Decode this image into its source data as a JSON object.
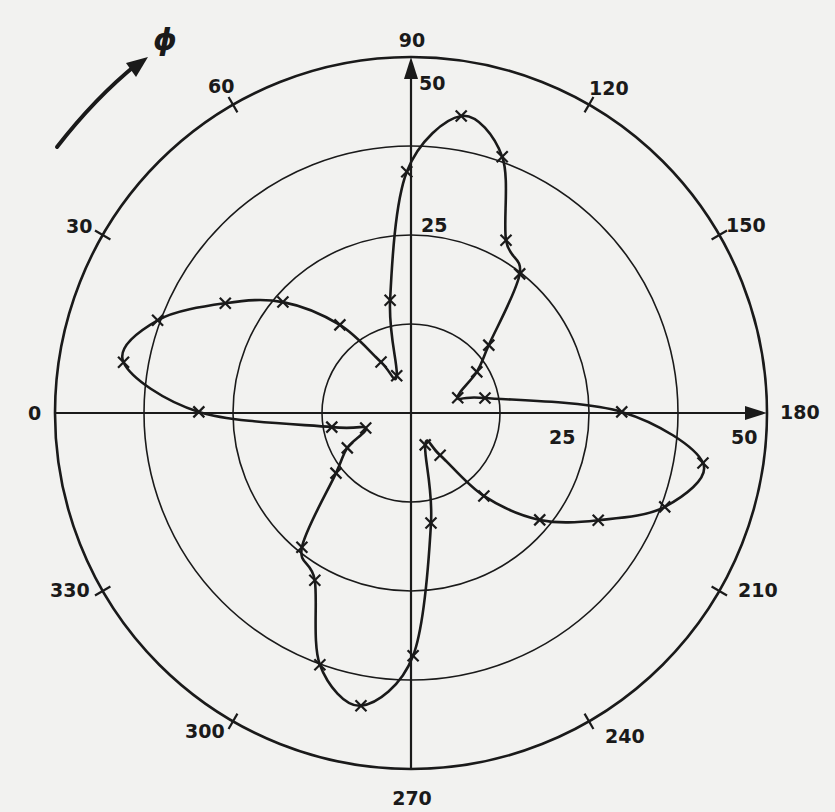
{
  "figure": {
    "background": "#f2f2f0",
    "ink": "#1a1a1a",
    "phi_label": "ϕ"
  },
  "chart_data": {
    "type": "polar_line",
    "title": "",
    "angle_symbol": "ϕ",
    "angle_direction": "clockwise from left (0 at left, 90 at top, 180 at right, 270 at bottom)",
    "angular_ticks": [
      "0",
      "30",
      "60",
      "90",
      "120",
      "150",
      "180",
      "210",
      "240",
      "270",
      "300",
      "330"
    ],
    "radial_rings": [
      12.5,
      25,
      37.5,
      50
    ],
    "radial_labels": [
      {
        "text": "25",
        "position": "upper axis"
      },
      {
        "text": "50",
        "position": "upper axis"
      },
      {
        "text": "25",
        "position": "right axis (below)"
      },
      {
        "text": "50",
        "position": "right axis (below)"
      }
    ],
    "rlim": [
      0,
      50
    ],
    "marker": "x",
    "series": [
      {
        "name": "measured",
        "points": [
          {
            "phi": 69,
            "r": 5.6
          },
          {
            "phi": 79.5,
            "r": 16.1
          },
          {
            "phi": 89,
            "r": 33.9
          },
          {
            "phi": 99.6,
            "r": 42.3
          },
          {
            "phi": 109.6,
            "r": 38.2
          },
          {
            "phi": 118.8,
            "r": 27.7
          },
          {
            "phi": 128,
            "r": 24.8
          },
          {
            "phi": 138.9,
            "r": 14.5
          },
          {
            "phi": 148,
            "r": 10.9
          },
          {
            "phi": 162,
            "r": 6.9
          },
          {
            "phi": 168.5,
            "r": 10.6
          },
          {
            "phi": 179.7,
            "r": 29.6
          },
          {
            "phi": 189.7,
            "r": 41.6
          },
          {
            "phi": 200.3,
            "r": 38.0
          },
          {
            "phi": 209.8,
            "r": 30.3
          },
          {
            "phi": 219.7,
            "r": 23.5
          },
          {
            "phi": 228.7,
            "r": 15.5
          },
          {
            "phi": 235.4,
            "r": 7.2
          },
          {
            "phi": 246,
            "r": 4.9
          },
          {
            "phi": 259.7,
            "r": 15.7
          },
          {
            "phi": 269.5,
            "r": 34.1
          },
          {
            "phi": 279.7,
            "r": 41.7
          },
          {
            "phi": 289.9,
            "r": 37.6
          },
          {
            "phi": 299.9,
            "r": 27.1
          },
          {
            "phi": 309.1,
            "r": 24.3
          },
          {
            "phi": 321.3,
            "r": 13.5
          },
          {
            "phi": 331.3,
            "r": 10.2
          },
          {
            "phi": 341.6,
            "r": 6.7
          },
          {
            "phi": 349.9,
            "r": 11.3
          },
          {
            "phi": 0.3,
            "r": 29.8
          },
          {
            "phi": 10,
            "r": 41.0
          },
          {
            "phi": 20.1,
            "r": 37.9
          },
          {
            "phi": 30.6,
            "r": 30.3
          },
          {
            "phi": 40.9,
            "r": 23.8
          },
          {
            "phi": 51.1,
            "r": 15.9
          },
          {
            "phi": 59.5,
            "r": 8.3
          }
        ]
      }
    ],
    "grid": true,
    "legend": "none"
  }
}
